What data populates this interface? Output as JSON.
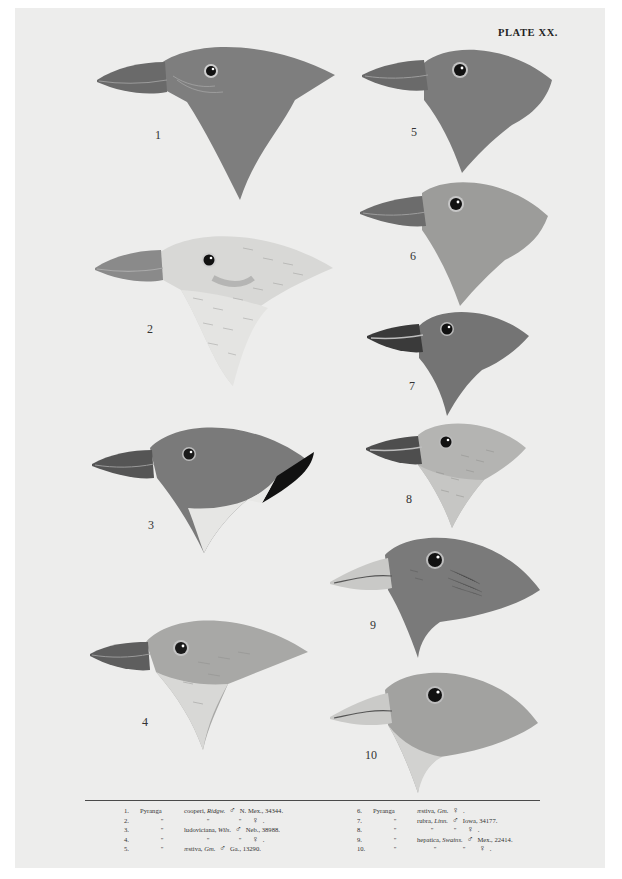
{
  "plate": {
    "title": "PLATE XX.",
    "background": "#ededec"
  },
  "figures": [
    {
      "number": "1",
      "tone": "#7e7e7e",
      "throat": "#7a7a7a",
      "style": "dark-solid"
    },
    {
      "number": "2",
      "tone": "#d6d6d4",
      "throat": "#e2e2e0",
      "style": "pale-streaked"
    },
    {
      "number": "3",
      "tone": "#7a7a7a",
      "throat": "#e8e8e6",
      "style": "dark-with-black-back"
    },
    {
      "number": "4",
      "tone": "#a8a8a6",
      "throat": "#d8d8d6",
      "style": "grey-pale-throat"
    },
    {
      "number": "5",
      "tone": "#7c7c7c",
      "throat": "#7c7c7c",
      "style": "dark-solid"
    },
    {
      "number": "6",
      "tone": "#9c9c9a",
      "throat": "#a4a4a2",
      "style": "mid-grey"
    },
    {
      "number": "7",
      "tone": "#747474",
      "throat": "#747474",
      "style": "dark-solid"
    },
    {
      "number": "8",
      "tone": "#b4b4b2",
      "throat": "#c8c8c6",
      "style": "pale-streaked"
    },
    {
      "number": "9",
      "tone": "#7a7a7a",
      "throat": "#8a8a88",
      "style": "dark-solid"
    },
    {
      "number": "10",
      "tone": "#a2a2a0",
      "throat": "#d0d0ce",
      "style": "grey-pale-throat"
    }
  ],
  "caption": {
    "left": [
      {
        "n": "1.",
        "genus": "Pyranga",
        "species": "cooperi,",
        "author": "Ridgw.",
        "sex": "♂",
        "locality": "N. Mex., 34344."
      },
      {
        "n": "2.",
        "genus": "\"",
        "species": "\"",
        "author": "\"",
        "sex": "♀",
        "locality": "."
      },
      {
        "n": "3.",
        "genus": "\"",
        "species": "ludoviciana,",
        "author": "Wils.",
        "sex": "♂",
        "locality": "Neb., 38988."
      },
      {
        "n": "4.",
        "genus": "\"",
        "species": "\"",
        "author": "\"",
        "sex": "♀",
        "locality": "."
      },
      {
        "n": "5.",
        "genus": "\"",
        "species": "æstiva,",
        "author": "Gm.",
        "sex": "♂",
        "locality": "Ga., 13290."
      }
    ],
    "right": [
      {
        "n": "6.",
        "genus": "Pyranga",
        "species": "æstiva,",
        "author": "Gm.",
        "sex": "♀",
        "locality": "."
      },
      {
        "n": "7.",
        "genus": "\"",
        "species": "rubra,",
        "author": "Linn.",
        "sex": "♂",
        "locality": "Iowa, 34177."
      },
      {
        "n": "8.",
        "genus": "\"",
        "species": "\"",
        "author": "\"",
        "sex": "♀",
        "locality": "."
      },
      {
        "n": "9.",
        "genus": "\"",
        "species": "hepatica,",
        "author": "Swains.",
        "sex": "♂",
        "locality": "Mex., 22414."
      },
      {
        "n": "10.",
        "genus": "\"",
        "species": "\"",
        "author": "\"",
        "sex": "♀",
        "locality": "."
      }
    ]
  }
}
